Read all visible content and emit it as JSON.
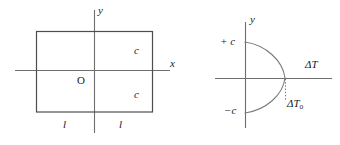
{
  "figure": {
    "stroke_color": "#6e6e6e",
    "rect_color": "#4d4d4d",
    "curve_color": "#7a7a7a",
    "text_color": "#1a1a1a",
    "background": "#ffffff"
  },
  "left_panel": {
    "name": "rectangular-cross-section-axes",
    "axis_y_label": "y",
    "axis_x_label": "x",
    "origin_label": "O",
    "half_height_top_label": "c",
    "half_height_bottom_label": "c",
    "half_width_left_label": "l",
    "half_width_right_label": "l",
    "rect": {
      "left": 36,
      "top": 31,
      "right": 153,
      "bottom": 112
    },
    "axis_x": {
      "x1": 15,
      "y1": 71,
      "x2": 170,
      "y2": 71
    },
    "axis_y": {
      "x1": 94,
      "y1": 10,
      "x2": 94,
      "y2": 133
    }
  },
  "right_panel": {
    "name": "parabola-stability-diagram",
    "axis_y_label": "y",
    "axis_x_label": "ΔT",
    "upper_limit_label": "+ c",
    "lower_limit_label": "−c",
    "critical_point_label_base": "ΔT",
    "critical_point_label_sub": "o",
    "axis_x": {
      "x1": 215,
      "y1": 78,
      "x2": 332,
      "y2": 78
    },
    "axis_y": {
      "x1": 245,
      "y1": 22,
      "x2": 245,
      "y2": 128
    },
    "curve": {
      "type": "leftward-parabola",
      "vertex": {
        "x": 285,
        "y": 78
      },
      "top_end": {
        "x": 245,
        "y": 42
      },
      "bottom_end": {
        "x": 245,
        "y": 113
      }
    },
    "dotted_drop_line": {
      "x": 285,
      "y1": 78,
      "y2": 100
    }
  }
}
